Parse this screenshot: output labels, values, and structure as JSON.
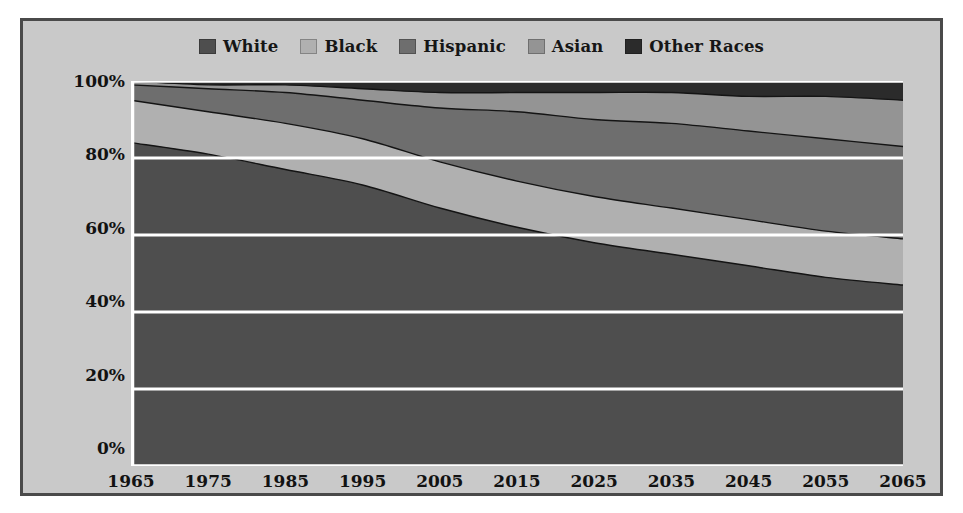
{
  "chart_data": {
    "type": "area",
    "stacked": true,
    "normalized": true,
    "title": "",
    "subtitle": "",
    "xlabel": "",
    "ylabel": "",
    "grid": true,
    "legend_position": "top-center",
    "x": [
      1965,
      1975,
      1985,
      1995,
      2005,
      2015,
      2025,
      2035,
      2045,
      2055,
      2065
    ],
    "categories": [
      "1965",
      "1975",
      "1985",
      "1995",
      "2005",
      "2015",
      "2025",
      "2035",
      "2045",
      "2055",
      "2065"
    ],
    "ylim": [
      0,
      100
    ],
    "yticks": [
      0,
      20,
      40,
      60,
      80,
      100
    ],
    "ytick_labels": [
      "0%",
      "20%",
      "40%",
      "60%",
      "80%",
      "100%"
    ],
    "xtick_labels": [
      "1965",
      "1975",
      "1985",
      "1995",
      "2005",
      "2015",
      "2025",
      "2035",
      "2045",
      "2055",
      "2065"
    ],
    "series": [
      {
        "name": "White",
        "color": "#4e4e4e",
        "values": [
          84,
          81,
          77,
          73,
          67,
          62,
          58,
          55,
          52,
          49,
          47
        ]
      },
      {
        "name": "Black",
        "color": "#b0b0b0",
        "values": [
          11,
          11,
          12,
          12,
          12,
          12,
          12,
          12,
          12,
          12,
          12
        ]
      },
      {
        "name": "Hispanic",
        "color": "#6e6e6e",
        "values": [
          4,
          6,
          8,
          10,
          14,
          18,
          20,
          22,
          23,
          24,
          24
        ]
      },
      {
        "name": "Asian",
        "color": "#949494",
        "values": [
          1,
          1,
          2,
          3,
          4,
          5,
          7,
          8,
          9,
          11,
          12
        ]
      },
      {
        "name": "Other Races",
        "color": "#2b2b2b",
        "values": [
          0,
          1,
          1,
          2,
          3,
          3,
          3,
          3,
          4,
          4,
          5
        ]
      }
    ]
  },
  "legend": {
    "items": [
      {
        "label": "White",
        "color": "#4e4e4e"
      },
      {
        "label": "Black",
        "color": "#b0b0b0"
      },
      {
        "label": "Hispanic",
        "color": "#6e6e6e"
      },
      {
        "label": "Asian",
        "color": "#949494"
      },
      {
        "label": "Other Races",
        "color": "#2b2b2b"
      }
    ]
  },
  "style": {
    "frame_border": "#4a4a4a",
    "panel_background": "#c9c9c9",
    "gridline_color": "#ffffff",
    "axis_text_color": "#121212",
    "page_background": "#ffffff"
  }
}
